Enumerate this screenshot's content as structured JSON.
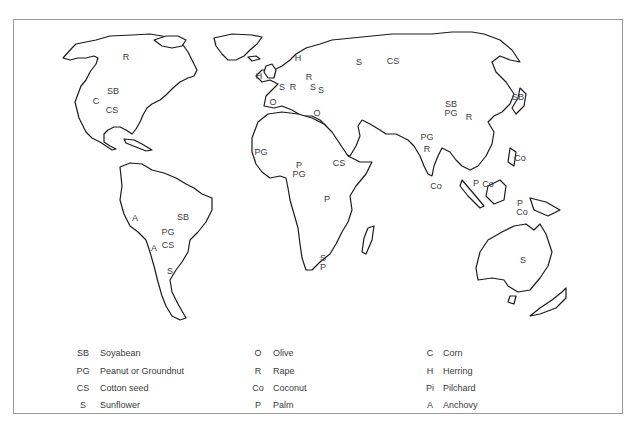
{
  "map": {
    "labels": [
      {
        "code": "R",
        "x": 126,
        "y": 57
      },
      {
        "code": "SB",
        "x": 113,
        "y": 91
      },
      {
        "code": "C",
        "x": 96,
        "y": 101
      },
      {
        "code": "CS",
        "x": 112,
        "y": 110
      },
      {
        "code": "H",
        "x": 259,
        "y": 76
      },
      {
        "code": "H",
        "x": 298,
        "y": 58
      },
      {
        "code": "R",
        "x": 309,
        "y": 77
      },
      {
        "code": "S",
        "x": 282,
        "y": 87
      },
      {
        "code": "R",
        "x": 293,
        "y": 87
      },
      {
        "code": "S",
        "x": 313,
        "y": 87
      },
      {
        "code": "S",
        "x": 321,
        "y": 90
      },
      {
        "code": "O",
        "x": 273,
        "y": 102
      },
      {
        "code": "O",
        "x": 317,
        "y": 113
      },
      {
        "code": "S",
        "x": 359,
        "y": 62
      },
      {
        "code": "CS",
        "x": 393,
        "y": 61
      },
      {
        "code": "SB",
        "x": 451,
        "y": 104
      },
      {
        "code": "PG",
        "x": 451,
        "y": 113
      },
      {
        "code": "R",
        "x": 469,
        "y": 117
      },
      {
        "code": "SB",
        "x": 518,
        "y": 97
      },
      {
        "code": "PG",
        "x": 427,
        "y": 137
      },
      {
        "code": "R",
        "x": 427,
        "y": 149
      },
      {
        "code": "Co",
        "x": 436,
        "y": 186
      },
      {
        "code": "Co",
        "x": 520,
        "y": 158
      },
      {
        "code": "P",
        "x": 476,
        "y": 183
      },
      {
        "code": "Co",
        "x": 488,
        "y": 184
      },
      {
        "code": "P",
        "x": 520,
        "y": 203
      },
      {
        "code": "Co",
        "x": 522,
        "y": 212
      },
      {
        "code": "PG",
        "x": 261,
        "y": 152
      },
      {
        "code": "P",
        "x": 299,
        "y": 165
      },
      {
        "code": "PG",
        "x": 299,
        "y": 174
      },
      {
        "code": "CS",
        "x": 339,
        "y": 163
      },
      {
        "code": "P",
        "x": 327,
        "y": 199
      },
      {
        "code": "S",
        "x": 323,
        "y": 258
      },
      {
        "code": "P",
        "x": 323,
        "y": 267
      },
      {
        "code": "A",
        "x": 135,
        "y": 218
      },
      {
        "code": "SB",
        "x": 183,
        "y": 217
      },
      {
        "code": "PG",
        "x": 168,
        "y": 232
      },
      {
        "code": "A",
        "x": 154,
        "y": 248
      },
      {
        "code": "CS",
        "x": 168,
        "y": 245
      },
      {
        "code": "S",
        "x": 170,
        "y": 271
      },
      {
        "code": "S",
        "x": 523,
        "y": 260
      }
    ]
  },
  "legend": {
    "columns": [
      [
        {
          "code": "SB",
          "name": "Soyabean"
        },
        {
          "code": "PG",
          "name": "Peanut or Groundnut"
        },
        {
          "code": "CS",
          "name": "Cotton seed"
        },
        {
          "code": "S",
          "name": "Sunflower"
        }
      ],
      [
        {
          "code": "O",
          "name": "Olive"
        },
        {
          "code": "R",
          "name": "Rape"
        },
        {
          "code": "Co",
          "name": "Coconut"
        },
        {
          "code": "P",
          "name": "Palm"
        }
      ],
      [
        {
          "code": "C",
          "name": "Corn"
        },
        {
          "code": "H",
          "name": "Herring"
        },
        {
          "code": "Pi",
          "name": "Pilchard"
        },
        {
          "code": "A",
          "name": "Anchovy"
        }
      ]
    ]
  }
}
